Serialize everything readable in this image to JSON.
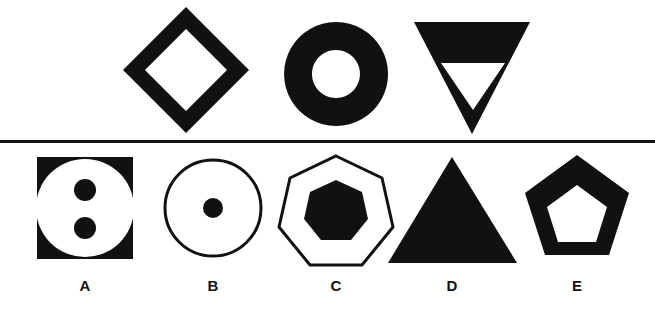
{
  "sheet": {
    "title": "Non-verbal reasoning figure series",
    "background_color": "#ffffff",
    "ink_color": "#111111",
    "width": 655,
    "height": 309
  },
  "divider": {
    "name": "horizontal-rule",
    "y": 141,
    "thickness": 3,
    "color": "#111111"
  },
  "question_row": {
    "label": "question-row",
    "figures": [
      {
        "id": "q1",
        "name": "diamond-outline",
        "description": "Rotated square (diamond) drawn as a thick black outline with a white square hole in the centre",
        "fill": "#111111",
        "hole": "#ffffff",
        "center_x": 186,
        "center_y": 70,
        "outer_radius": 63,
        "inner_radius": 41
      },
      {
        "id": "q2",
        "name": "annulus-donut",
        "description": "Solid black circle with a concentric white circular hole (annulus / donut)",
        "fill": "#111111",
        "hole": "#ffffff",
        "center_x": 336,
        "center_y": 74,
        "outer_radius": 52,
        "inner_radius": 24
      },
      {
        "id": "q3",
        "name": "inverted-triangle-outline",
        "description": "Downward pointing black triangle containing a smaller white downward pointing triangle",
        "fill": "#111111",
        "hole": "#ffffff",
        "center_x": 472,
        "top_y": 22,
        "bottom_y": 134,
        "half_width": 58
      }
    ]
  },
  "answer_row": {
    "label": "answer-row",
    "options": [
      {
        "id": "A",
        "label": "A",
        "name": "option-a",
        "description": "Black square containing a white circle with two small black dots stacked vertically",
        "center_x": 85,
        "center_y": 208,
        "label_x": 85,
        "label_y": 286
      },
      {
        "id": "B",
        "label": "B",
        "name": "option-b",
        "description": "Thin black circle outline containing one small black dot at the centre",
        "center_x": 213,
        "center_y": 208,
        "label_x": 213,
        "label_y": 286
      },
      {
        "id": "C",
        "label": "C",
        "name": "option-c",
        "description": "Thin black heptagon outline containing a smaller solid black heptagon",
        "center_x": 336,
        "center_y": 209,
        "label_x": 336,
        "label_y": 286
      },
      {
        "id": "D",
        "label": "D",
        "name": "option-d",
        "description": "Solid black upward pointing triangle",
        "center_x": 452,
        "center_y": 211,
        "label_x": 452,
        "label_y": 286
      },
      {
        "id": "E",
        "label": "E",
        "name": "option-e",
        "description": "Black pentagon drawn as a thick outline with a white pentagon hole in the centre",
        "center_x": 577,
        "center_y": 208,
        "label_x": 577,
        "label_y": 286
      }
    ]
  }
}
